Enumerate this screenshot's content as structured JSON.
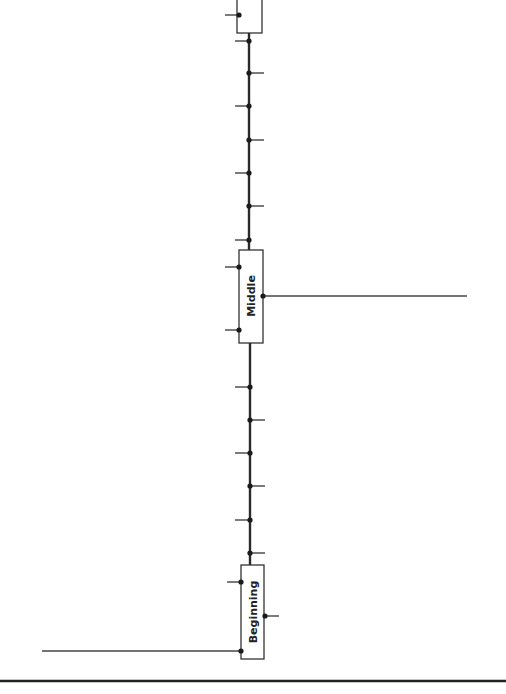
{
  "diagram": {
    "type": "timeline-spine",
    "colors": {
      "line": "#333333",
      "dot": "#1a1a1a",
      "box_border": "#333333",
      "rule": "#222222",
      "background": "#ffffff"
    },
    "boxes": [
      {
        "id": "top",
        "label": ""
      },
      {
        "id": "middle",
        "label": "Middle"
      },
      {
        "id": "beginning",
        "label": "Beginning"
      }
    ],
    "spine_ticks": {
      "upper": [
        "left",
        "right",
        "left",
        "right",
        "left",
        "right",
        "left"
      ],
      "lower": [
        "left",
        "right",
        "left",
        "right",
        "left",
        "right"
      ]
    },
    "connections": [
      {
        "from": "middle",
        "side": "right",
        "extends_to": "right-edge"
      },
      {
        "from": "beginning",
        "side": "left",
        "extends_to": "left-edge"
      }
    ]
  }
}
